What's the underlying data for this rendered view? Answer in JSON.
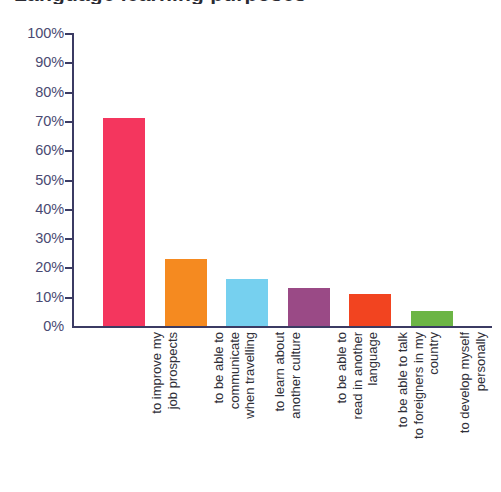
{
  "title_clipped": "Language learning purposes",
  "chart_data": {
    "type": "bar",
    "title": "Language learning purposes",
    "xlabel": "",
    "ylabel": "",
    "ylim": [
      0,
      100
    ],
    "ytick_labels": [
      "100%",
      "90%",
      "80%",
      "70%",
      "60%",
      "50%",
      "40%",
      "30%",
      "20%",
      "10%",
      "0%"
    ],
    "ytick_values": [
      100,
      90,
      80,
      70,
      60,
      50,
      40,
      30,
      20,
      10,
      0
    ],
    "grid": false,
    "legend": "none",
    "categories": [
      "to improve my job prospects",
      "to be able to communicate when travelling",
      "to learn about another culture",
      "to be able to read in another language",
      "to be able to talk to foreigners in my country",
      "to develop myself personally"
    ],
    "category_lines": [
      [
        "to improve my",
        "job prospects"
      ],
      [
        "to be able to",
        "communicate",
        "when travelling"
      ],
      [
        "to learn about",
        "another culture"
      ],
      [
        "to be able to",
        "read in another",
        "language"
      ],
      [
        "to be able to talk",
        "to foreigners in my",
        "country"
      ],
      [
        "to develop myself",
        "personally"
      ]
    ],
    "values": [
      71,
      23,
      16,
      13,
      11,
      5
    ],
    "colors": [
      "#F4365E",
      "#F58A20",
      "#76D0EF",
      "#9A4A86",
      "#F24420",
      "#6CB545"
    ]
  },
  "axis": {
    "line_color": "#3b3b63",
    "label_color": "#4a4a72"
  }
}
